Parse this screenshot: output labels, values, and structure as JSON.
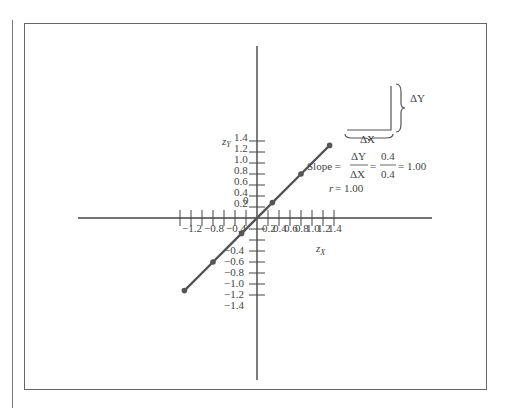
{
  "chart_data": {
    "type": "line",
    "title": "",
    "xlabel": "z_X",
    "ylabel": "z_Y",
    "xlim": [
      -1.4,
      1.4
    ],
    "ylim": [
      -1.5,
      1.5
    ],
    "grid": false,
    "x_tick_labels": [
      "-1.2",
      "-0.8",
      "-0.4",
      "0.2",
      "0.4",
      "0.6",
      "0.8",
      "1.0",
      "1.2",
      "1.4"
    ],
    "y_tick_labels": [
      "1.4",
      "1.2",
      "1.0",
      "0.8",
      "0.6",
      "0.4",
      "0.2",
      "0",
      "-0.4",
      "-0.6",
      "-0.8",
      "-1.0",
      "-1.2",
      "-1.4"
    ],
    "series": [
      {
        "name": "z_Y vs z_X",
        "x": [
          -1.32,
          -0.8,
          -0.28,
          0.28,
          0.8,
          1.32
        ],
        "y": [
          -1.32,
          -0.8,
          -0.28,
          0.28,
          0.8,
          1.32
        ]
      }
    ],
    "annotations": {
      "delta_y": "ΔY",
      "delta_x": "ΔX",
      "slope_label": "Slope =",
      "slope_num": "ΔY",
      "slope_den": "ΔX",
      "value_num": "0.4",
      "value_den": "0.4",
      "slope_result": "= 1.00",
      "r_label": "r",
      "r_value": "= 1.00"
    }
  },
  "axes": {
    "x_label_main": "z",
    "x_label_sub": "X",
    "y_label_main": "z",
    "y_label_sub": "Y",
    "origin_label": "0"
  }
}
